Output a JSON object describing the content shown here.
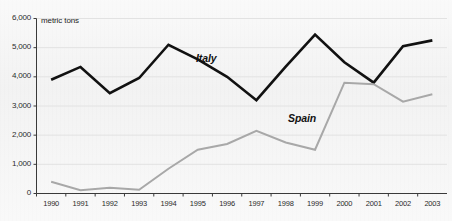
{
  "chart_data": {
    "type": "line",
    "title": "",
    "subtitle": "",
    "unit_label": "metric tons",
    "xlabel": "",
    "ylabel": "",
    "grid": true,
    "legend_position": "inline-annotations",
    "ylim": [
      0,
      6000
    ],
    "y_ticks": [
      "0",
      "1,000",
      "2,000",
      "3,000",
      "4,000",
      "5,000",
      "6,000"
    ],
    "y_tick_values": [
      0,
      1000,
      2000,
      3000,
      4000,
      5000,
      6000
    ],
    "categories": [
      "1990",
      "1991",
      "1992",
      "1993",
      "1994",
      "1995",
      "1996",
      "1997",
      "1998",
      "1999",
      "2000",
      "2001",
      "2002",
      "2003"
    ],
    "x": [
      1990,
      1991,
      1992,
      1993,
      1994,
      1995,
      1996,
      1997,
      1998,
      1999,
      2000,
      2001,
      2002,
      2003
    ],
    "series": [
      {
        "name": "Italy",
        "color": "#111111",
        "values": [
          3900,
          4340,
          3440,
          3960,
          5100,
          4600,
          4000,
          3200,
          4350,
          5450,
          4500,
          3800,
          5050,
          5250
        ]
      },
      {
        "name": "Spain",
        "color": "#a8a8a8",
        "values": [
          400,
          110,
          200,
          130,
          850,
          1500,
          1700,
          2150,
          1750,
          1500,
          3800,
          3750,
          3150,
          3400
        ]
      }
    ],
    "annotations": [
      {
        "text": "Italy",
        "series": "Italy",
        "x_px": 196,
        "y_px": 52
      },
      {
        "text": "Spain",
        "series": "Spain",
        "x_px": 288,
        "y_px": 112
      }
    ],
    "colors": {
      "background": "#f3f3f3",
      "axis": "#3a3a3a",
      "gridline": "#e2e2e2",
      "italy_line": "#111111",
      "spain_line": "#a8a8a8",
      "tick_text": "#2b2b2b"
    }
  }
}
